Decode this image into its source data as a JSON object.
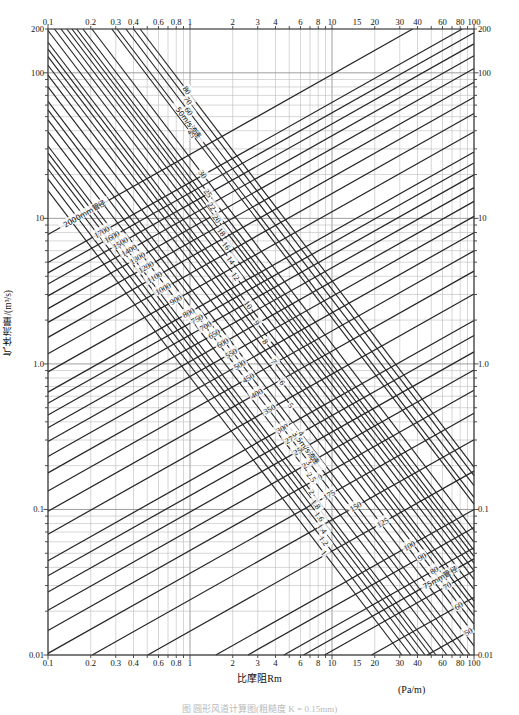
{
  "figure": {
    "y_axis_label": "气体流量/(m³/s)",
    "x_axis_label": "比摩阻Rm",
    "x_axis_unit": "(Pa/m)",
    "caption": "图   圆形风道计算图(粗糙度 K = 0.15mm)"
  },
  "chart_data": {
    "type": "line",
    "plot_kind": "nomogram",
    "xlabel": "比摩阻Rm",
    "xunit": "(Pa/m)",
    "ylabel": "气体流量/(m³/s)",
    "xscale": "log",
    "yscale": "log",
    "xlim": [
      0.1,
      100
    ],
    "ylim": [
      0.01,
      200
    ],
    "grid": true,
    "x_ticks": [
      "0.1",
      "0.2",
      "0.3",
      "0.4",
      "0.6",
      "0.8",
      "1",
      "2",
      "3",
      "4",
      "6",
      "8",
      "10",
      "15",
      "20",
      "30",
      "40",
      "60",
      "80",
      "100"
    ],
    "x_tick_values": [
      0.1,
      0.2,
      0.3,
      0.4,
      0.6,
      0.8,
      1,
      2,
      3,
      4,
      6,
      8,
      10,
      15,
      20,
      30,
      40,
      60,
      80,
      100
    ],
    "y_ticks": [
      "200",
      "100",
      "10",
      "1.0",
      "0.1",
      "0.01"
    ],
    "y_tick_values": [
      200,
      100,
      10,
      1.0,
      0.1,
      0.01
    ],
    "y_ticks_right": [
      "200",
      "100",
      "10",
      "1.0",
      "0.1",
      "0.01"
    ],
    "series": [
      {
        "name": "管径 (duct diameter, mm)",
        "label_suffix": "mm管径",
        "orientation": "up-right diagonal",
        "values": [
          2000,
          1700,
          1600,
          1500,
          1400,
          1300,
          1200,
          1100,
          1000,
          900,
          800,
          750,
          700,
          650,
          600,
          550,
          500,
          450,
          400,
          350,
          300,
          275,
          250,
          225,
          200,
          175,
          150,
          125,
          100,
          90,
          80,
          75,
          70,
          60,
          50,
          40
        ],
        "labels": [
          "2000mm管径",
          "1700",
          "1600",
          "1500",
          "1400",
          "1300",
          "1200",
          "1100",
          "1000",
          "900",
          "800",
          "750",
          "700",
          "650",
          "600",
          "550",
          "500",
          "450",
          "400",
          "350",
          "300",
          "275",
          "250",
          "225",
          "200",
          "175",
          "150",
          "125",
          "100",
          "90",
          "80",
          "75mm管径",
          "70",
          "60",
          "50",
          "40"
        ]
      },
      {
        "name": "流速 (air velocity, m/s)",
        "label_suffix": "m/s流速",
        "orientation": "down-right diagonal",
        "values": [
          1,
          1.2,
          1.4,
          1.6,
          1.8,
          2,
          2.5,
          3,
          3.5,
          4,
          5,
          6,
          7,
          8,
          9,
          10,
          12,
          14,
          16,
          18,
          20,
          22,
          25,
          30,
          45,
          50,
          60,
          70,
          80
        ],
        "labels": [
          "1",
          "1.2",
          "1.4",
          "1.6",
          "1.8",
          "2",
          "2.5",
          "3",
          "3.5m/s流速",
          "4",
          "5",
          "6",
          "7",
          "8",
          "9",
          "10",
          "12",
          "14",
          "16",
          "18",
          "20",
          "22",
          "25",
          "30",
          "45",
          "50m/s流速",
          "60",
          "70",
          "80"
        ]
      }
    ]
  }
}
